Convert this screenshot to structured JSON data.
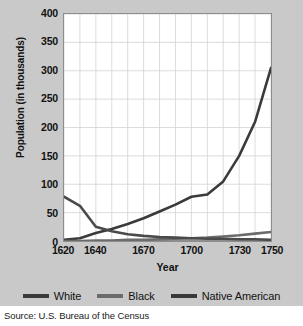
{
  "figure": {
    "background_color": "#c9c9c9",
    "plot_background_color": "#ffffff",
    "source_note": "Source: U.S. Bureau of the Census"
  },
  "chart_data": {
    "type": "line",
    "title": "",
    "subtitle": "",
    "xlabel": "Year",
    "ylabel": "Population (in thousands)",
    "xlim": [
      1620,
      1750
    ],
    "ylim": [
      0,
      400
    ],
    "grid": true,
    "x_tick_labels": [
      "1620",
      "1640",
      "1670",
      "1700",
      "1730",
      "1750"
    ],
    "x_tick_values": [
      1620,
      1640,
      1670,
      1700,
      1730,
      1750
    ],
    "y_tick_labels": [
      "0",
      "50",
      "100",
      "150",
      "200",
      "250",
      "300",
      "350",
      "400"
    ],
    "y_tick_values": [
      0,
      50,
      100,
      150,
      200,
      250,
      300,
      350,
      400
    ],
    "grid_x_step": 10,
    "grid_y_step": 50,
    "legend_position": "bottom",
    "series": [
      {
        "name": "White",
        "color": "#3a3a3a",
        "x": [
          1620,
          1630,
          1640,
          1650,
          1660,
          1670,
          1680,
          1690,
          1700,
          1710,
          1720,
          1730,
          1740,
          1750
        ],
        "values": [
          2,
          5,
          14,
          21,
          30,
          40,
          52,
          64,
          78,
          82,
          105,
          150,
          210,
          305
        ]
      },
      {
        "name": "Black",
        "color": "#6b6b6b",
        "x": [
          1620,
          1630,
          1640,
          1650,
          1660,
          1670,
          1680,
          1690,
          1700,
          1710,
          1720,
          1730,
          1740,
          1750
        ],
        "values": [
          0,
          0,
          1,
          1,
          2,
          2,
          3,
          4,
          5,
          6,
          8,
          10,
          13,
          16
        ]
      },
      {
        "name": "Native American",
        "color": "#4a4a4a",
        "x": [
          1620,
          1630,
          1640,
          1650,
          1660,
          1670,
          1680,
          1690,
          1700,
          1710,
          1720,
          1730,
          1740,
          1750
        ],
        "values": [
          78,
          62,
          25,
          17,
          12,
          9,
          7,
          6,
          5,
          4,
          4,
          3,
          3,
          2
        ]
      }
    ]
  },
  "legend": {
    "items": [
      {
        "label": "White",
        "color": "#3a3a3a"
      },
      {
        "label": "Black",
        "color": "#6b6b6b"
      },
      {
        "label": "Native American",
        "color": "#3a3a3a"
      }
    ]
  }
}
